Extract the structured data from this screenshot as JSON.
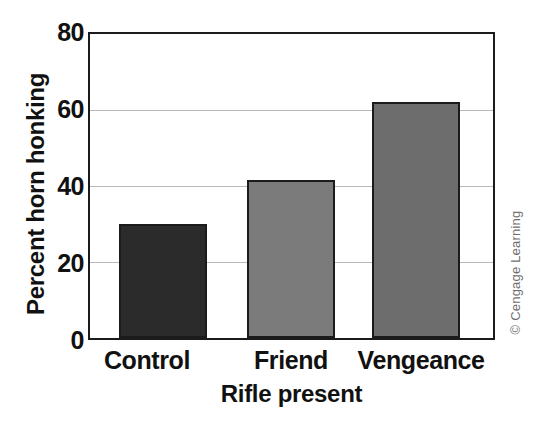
{
  "chart_data": {
    "type": "bar",
    "title": "",
    "subtitle": "",
    "xlabel": "Rifle present",
    "ylabel": "Percent horn honking",
    "categories": [
      "Control",
      "Friend",
      "Vengeance"
    ],
    "values": [
      30,
      41.5,
      62
    ],
    "series": [
      {
        "name": "Percent horn honking",
        "values": [
          30,
          41.5,
          62
        ]
      }
    ],
    "ylim": [
      0,
      80
    ],
    "yticks": [
      0,
      20,
      40,
      60,
      80
    ],
    "ytick_labels": [
      "0",
      "20",
      "40",
      "60",
      "80"
    ],
    "grid": "horizontal",
    "legend": "none",
    "bar_colors": [
      "#2b2b2b",
      "#7b7b7b",
      "#6d6d6d"
    ],
    "bar_edge_color": "#1b1b1b",
    "grid_color": "#b9b9b9",
    "axis_color": "#1b1b1b",
    "background": "#ffffff",
    "annotations": []
  },
  "credit": {
    "text": "© Cengage Learning"
  },
  "top_caption": {
    "text": ""
  }
}
